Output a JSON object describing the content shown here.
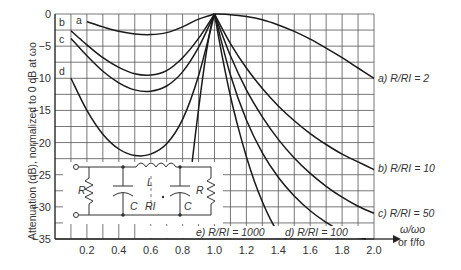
{
  "chart_data": {
    "type": "line",
    "title": "",
    "xlabel": "ω/ωo or f/fo",
    "ylabel": "Attenuation (dB), normalized to 0 dB at ωo",
    "xlim": [
      0.0,
      2.0
    ],
    "ylim": [
      -35,
      0
    ],
    "grid": true,
    "x_grid_step": 0.1,
    "y_grid_step": 2.5,
    "x_ticks": [
      0.2,
      0.4,
      0.6,
      0.8,
      1.0,
      1.2,
      1.4,
      1.6,
      1.8,
      2.0
    ],
    "x_tick_labels": [
      "0.2",
      "0.4",
      "0.6",
      "0.8",
      "1.0",
      "1.2",
      "1.4",
      "1.6",
      "1.8",
      "2.0"
    ],
    "y_ticks": [
      0,
      -5,
      -10,
      -15,
      -20,
      -25,
      -30,
      -35
    ],
    "y_tick_labels": [
      "0",
      "−5",
      "−10",
      "−15",
      "−20",
      "−25",
      "−30",
      "−35"
    ],
    "series": [
      {
        "name": "a) R/RI = 2",
        "letter": "a",
        "x": [
          0.2,
          0.3,
          0.4,
          0.5,
          0.6,
          0.7,
          0.8,
          0.9,
          1.0,
          1.1,
          1.2,
          1.3,
          1.4,
          1.5,
          1.6,
          1.7,
          1.8,
          1.9,
          2.0
        ],
        "y": [
          -1.2,
          -2.0,
          -2.7,
          -3.1,
          -3.2,
          -2.9,
          -2.0,
          -0.8,
          0,
          -0.1,
          -0.4,
          -0.9,
          -1.7,
          -2.7,
          -3.9,
          -5.3,
          -6.8,
          -8.4,
          -10.0
        ]
      },
      {
        "name": "b) R/RI = 10",
        "letter": "b",
        "x": [
          0.1,
          0.2,
          0.3,
          0.4,
          0.5,
          0.6,
          0.7,
          0.8,
          0.9,
          1.0,
          1.1,
          1.2,
          1.3,
          1.4,
          1.5,
          1.6,
          1.7,
          1.8,
          1.9,
          2.0
        ],
        "y": [
          -2.6,
          -4.8,
          -6.8,
          -8.3,
          -9.3,
          -9.5,
          -8.8,
          -6.8,
          -3.8,
          0,
          -4.6,
          -8.4,
          -11.6,
          -14.3,
          -16.6,
          -18.6,
          -20.3,
          -21.8,
          -23.0,
          -24.2
        ]
      },
      {
        "name": "c) R/RI = 50",
        "letter": "c",
        "x": [
          0.1,
          0.2,
          0.3,
          0.4,
          0.5,
          0.6,
          0.7,
          0.8,
          0.9,
          1.0,
          1.1,
          1.2,
          1.3,
          1.4,
          1.5,
          1.6,
          1.7,
          1.8,
          1.9,
          2.0
        ],
        "y": [
          -3.8,
          -6.5,
          -8.9,
          -10.7,
          -11.8,
          -12.0,
          -11.2,
          -9.0,
          -5.2,
          0,
          -6.5,
          -11.8,
          -16.0,
          -19.5,
          -22.4,
          -24.8,
          -26.8,
          -28.5,
          -29.9,
          -31.0
        ]
      },
      {
        "name": "d) R/RI = 100",
        "letter": "d",
        "x": [
          0.1,
          0.2,
          0.3,
          0.4,
          0.5,
          0.6,
          0.7,
          0.8,
          0.9,
          1.0,
          1.1,
          1.2,
          1.3,
          1.4,
          1.5,
          1.6,
          1.7,
          1.8,
          1.9,
          1.95
        ],
        "y": [
          -10.0,
          -15.0,
          -18.7,
          -21.0,
          -22.0,
          -21.8,
          -20.2,
          -16.4,
          -9.6,
          0,
          -9.5,
          -16.5,
          -21.6,
          -25.4,
          -28.3,
          -30.6,
          -32.4,
          -33.8,
          -34.7,
          -35.0
        ]
      },
      {
        "name": "e) R/RI = 1000",
        "letter": "e",
        "x": [
          0.86,
          0.88,
          0.9,
          0.92,
          0.94,
          0.96,
          0.98,
          1.0,
          1.05,
          1.1,
          1.15,
          1.2,
          1.25,
          1.3,
          1.35,
          1.4,
          1.45
        ],
        "y": [
          -23.0,
          -18.8,
          -14.8,
          -11.0,
          -7.4,
          -4.3,
          -1.7,
          0,
          -6.8,
          -12.8,
          -17.8,
          -22.2,
          -26.0,
          -29.2,
          -31.9,
          -34.0,
          -35.0
        ]
      }
    ],
    "legend_position": "right / bottom annotations"
  },
  "labels": {
    "y_axis": "Attenuation (dB), normalized to 0 dB at ωo",
    "x_axis_line1": "ω/ωo",
    "x_axis_line2": "or f/fo",
    "curve_letters": [
      "a",
      "b",
      "c",
      "d"
    ],
    "annot_a": "a)  R/RI = 2",
    "annot_b": "b)  R/RI = 10",
    "annot_c": "c)  R/RI = 50",
    "annot_d": "d)  R/RI = 100",
    "annot_e": "e)  R/RI = 1000"
  },
  "circuit": {
    "R_left": "R",
    "C_left": "C",
    "L": "L",
    "RI": "RI",
    "C_right": "C",
    "R_right": "R"
  }
}
